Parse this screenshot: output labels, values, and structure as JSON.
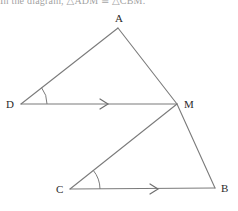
{
  "header": {
    "clipped_text": "In the diagram, △ADM ≅ △CBM."
  },
  "figure": {
    "name": "two-triangles-parallel-lines-diagram",
    "stroke_color": "#7b7b7b",
    "label_color": "#2b2b2b",
    "background_color": "#ffffff",
    "vertices": [
      {
        "id": "A",
        "label": "A",
        "x": 118,
        "y": 28,
        "label_x": 115,
        "label_y": 22
      },
      {
        "id": "D",
        "label": "D",
        "x": 21,
        "y": 104,
        "label_x": 6,
        "label_y": 108
      },
      {
        "id": "M",
        "label": "M",
        "x": 177,
        "y": 104,
        "label_x": 184,
        "label_y": 108
      },
      {
        "id": "C",
        "label": "C",
        "x": 70,
        "y": 189,
        "label_x": 56,
        "label_y": 193
      },
      {
        "id": "B",
        "label": "B",
        "x": 215,
        "y": 188,
        "label_x": 221,
        "label_y": 192
      }
    ],
    "segments": [
      {
        "id": "DA",
        "from": "D",
        "to": "A"
      },
      {
        "id": "AM",
        "from": "A",
        "to": "M"
      },
      {
        "id": "DM",
        "from": "D",
        "to": "M",
        "tick_marks": 1
      },
      {
        "id": "MB",
        "from": "M",
        "to": "B"
      },
      {
        "id": "MC",
        "from": "M",
        "to": "C"
      },
      {
        "id": "CB",
        "from": "C",
        "to": "B",
        "tick_marks": 1
      }
    ],
    "angle_arcs": [
      {
        "id": "angle-D",
        "vertex": "D",
        "radius": 26
      },
      {
        "id": "angle-C",
        "vertex": "C",
        "radius": 30
      }
    ],
    "parallel_markers": [
      {
        "id": "arrow-DM",
        "on": "DM",
        "x": 104,
        "y": 104,
        "style": "single-chevron"
      },
      {
        "id": "arrow-CB",
        "on": "CB",
        "x": 154,
        "y": 189,
        "style": "single-chevron"
      }
    ]
  }
}
